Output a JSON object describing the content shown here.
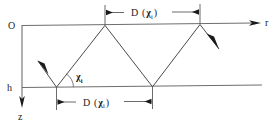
{
  "figure": {
    "type": "diagram",
    "background_color": "#ffffff",
    "line_color": "#6e6e6e",
    "ray_color": "#4a4a4a",
    "text_color": "#1a1a1a"
  },
  "axes": {
    "origin_label": "O",
    "horizontal_axis_label": "r",
    "vertical_axis_label": "z",
    "depth_label": "h",
    "horizontal_axis_direction": "right",
    "vertical_axis_direction": "down"
  },
  "dimensions": {
    "top": {
      "label_main": "D",
      "label_open_paren": "(",
      "label_symbol": "χ",
      "label_subscript": "i",
      "label_close_paren": ")",
      "full_label": "D (χi)"
    },
    "bottom": {
      "label_main": "D",
      "label_open_paren": "(",
      "label_symbol": "χ",
      "label_subscript": "i",
      "label_close_paren": ")",
      "full_label": "D (χi)"
    }
  },
  "angle": {
    "symbol": "χ",
    "subscript": "i",
    "full_label": "χi"
  },
  "rays": {
    "incoming_arrow": "downward-right-arrow",
    "outgoing_arrow": "downward-right-arrow",
    "path_description": "zigzag ray reflecting between surface and depth h"
  }
}
